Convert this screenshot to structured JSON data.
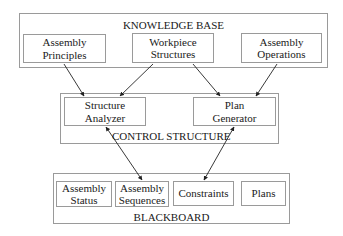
{
  "knowledge_base": {
    "title": "KNOWLEDGE BASE",
    "items": [
      {
        "line1": "Assembly",
        "line2": "Principles"
      },
      {
        "line1": "Workpiece",
        "line2": "Structures"
      },
      {
        "line1": "Assembly",
        "line2": "Operations"
      }
    ]
  },
  "control_structure": {
    "title": "CONTROL STRUCTURE",
    "items": [
      {
        "line1": "Structure",
        "line2": "Analyzer"
      },
      {
        "line1": "Plan",
        "line2": "Generator"
      }
    ]
  },
  "blackboard": {
    "title": "BLACKBOARD",
    "items": [
      {
        "line1": "Assembly",
        "line2": "Status"
      },
      {
        "line1": "Assembly",
        "line2": "Sequences"
      },
      {
        "line1": "Constraints",
        "line2": ""
      },
      {
        "line1": "Plans",
        "line2": ""
      }
    ]
  },
  "connections": [
    {
      "from": "Assembly Principles",
      "to": "Structure Analyzer",
      "type": "one-way"
    },
    {
      "from": "Workpiece Structures",
      "to": "Structure Analyzer",
      "type": "one-way"
    },
    {
      "from": "Workpiece Structures",
      "to": "Plan Generator",
      "type": "one-way"
    },
    {
      "from": "Assembly Operations",
      "to": "Plan Generator",
      "type": "one-way"
    },
    {
      "from": "Structure Analyzer",
      "to": "Assembly Sequences",
      "type": "two-way"
    },
    {
      "from": "Plan Generator",
      "to": "Constraints",
      "type": "two-way"
    }
  ],
  "colors": {
    "border": "#9a9a9a",
    "text": "#1a1a1a",
    "arrow": "#222222"
  }
}
